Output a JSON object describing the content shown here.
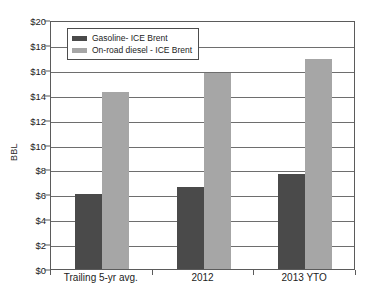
{
  "chart_data": {
    "type": "bar",
    "title": "",
    "subtitle": "",
    "xlabel": "",
    "ylabel": "BBL",
    "ylim": [
      0,
      20
    ],
    "ytick_step": 2,
    "ytick_labels": [
      "$0",
      "$2",
      "$4",
      "$6",
      "$8",
      "$10",
      "$12",
      "$14",
      "$16",
      "$18",
      "$20"
    ],
    "ytick_values": [
      0,
      2,
      4,
      6,
      8,
      10,
      12,
      14,
      16,
      18,
      20
    ],
    "grid": true,
    "legend_position": "top-left-inside",
    "categories": [
      "Trailing 5-yr avg.",
      "2012",
      "2013 YTO"
    ],
    "series": [
      {
        "name": "Gasoline- ICE Brent",
        "color": "#4a4a4a",
        "values": [
          6.0,
          6.55,
          7.65
        ]
      },
      {
        "name": "On-road diesel - ICE Brent",
        "color": "#a6a6a6",
        "values": [
          14.25,
          15.75,
          16.9
        ]
      }
    ],
    "axis_color": "#5b5b5b",
    "grid_color": "#6e6e6e",
    "background": "#ffffff"
  },
  "legend": {
    "entries": [
      {
        "label": "Gasoline- ICE Brent"
      },
      {
        "label": "On-road diesel - ICE Brent"
      }
    ]
  }
}
